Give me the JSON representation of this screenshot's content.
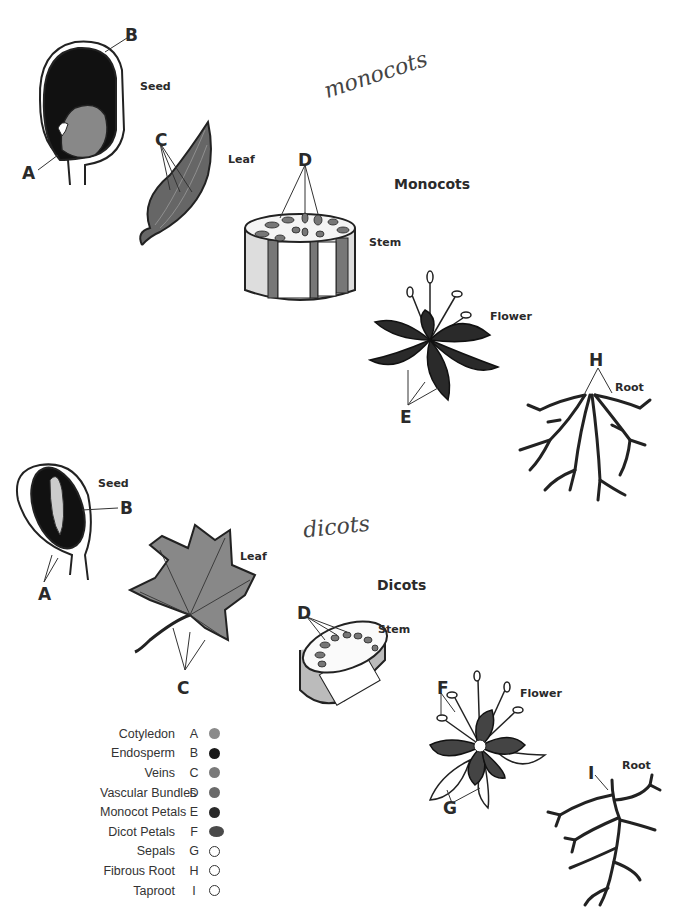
{
  "monocots": {
    "handwritten_title": "monocots",
    "title": "Monocots",
    "parts": {
      "seed": "Seed",
      "leaf": "Leaf",
      "stem": "Stem",
      "flower": "Flower",
      "root": "Root"
    },
    "letters": {
      "a": "A",
      "b": "B",
      "c": "C",
      "d": "D",
      "e": "E",
      "h": "H"
    }
  },
  "dicots": {
    "handwritten_title": "dicots",
    "title": "Dicots",
    "parts": {
      "seed": "Seed",
      "leaf": "Leaf",
      "stem": "Stem",
      "flower": "Flower",
      "root": "Root"
    },
    "letters": {
      "a": "A",
      "b": "B",
      "c": "C",
      "d": "D",
      "f": "F",
      "g": "G",
      "i": "I"
    }
  },
  "legend": [
    {
      "name": "Cotyledon",
      "letter": "A",
      "color": "#8a8a8a",
      "filled": true
    },
    {
      "name": "Endosperm",
      "letter": "B",
      "color": "#1a1a1a",
      "filled": true
    },
    {
      "name": "Veins",
      "letter": "C",
      "color": "#7a7a7a",
      "filled": true
    },
    {
      "name": "Vascular Bundles",
      "letter": "D",
      "color": "#6a6a6a",
      "filled": true
    },
    {
      "name": "Monocot Petals",
      "letter": "E",
      "color": "#2a2a2a",
      "filled": true
    },
    {
      "name": "Dicot Petals",
      "letter": "F",
      "color": "#4a4a4a",
      "filled": true
    },
    {
      "name": "Sepals",
      "letter": "G",
      "color": "#ffffff",
      "filled": false
    },
    {
      "name": "Fibrous Root",
      "letter": "H",
      "color": "#ffffff",
      "filled": false
    },
    {
      "name": "Taproot",
      "letter": "I",
      "color": "#ffffff",
      "filled": false
    }
  ]
}
